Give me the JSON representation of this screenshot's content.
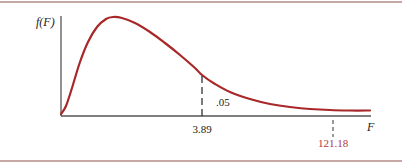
{
  "chart_data": {
    "type": "line",
    "title": "",
    "subtitle": "",
    "xlabel": "F",
    "ylabel": "f(F)",
    "grid": false,
    "legend": null,
    "x_ticks": [
      {
        "value": 3.89,
        "label": "3.89",
        "color": "#222222"
      },
      {
        "value": 121.18,
        "label": "121.18",
        "color": "#b03a3a"
      }
    ],
    "annotations": [
      {
        "text": ".05",
        "meaning": "upper-tail area to the right of 3.89"
      }
    ],
    "series": [
      {
        "name": "f(F)",
        "color": "#a8282a",
        "points_px": [
          [
            61,
            114
          ],
          [
            66,
            106
          ],
          [
            72,
            88
          ],
          [
            80,
            62
          ],
          [
            88,
            42
          ],
          [
            97,
            27
          ],
          [
            106,
            19
          ],
          [
            113,
            17
          ],
          [
            122,
            18
          ],
          [
            135,
            23
          ],
          [
            150,
            32
          ],
          [
            165,
            43
          ],
          [
            180,
            55
          ],
          [
            195,
            68
          ],
          [
            202,
            75
          ],
          [
            215,
            84
          ],
          [
            230,
            92
          ],
          [
            250,
            99
          ],
          [
            270,
            104
          ],
          [
            290,
            107
          ],
          [
            310,
            109
          ],
          [
            330,
            110
          ],
          [
            350,
            110.5
          ],
          [
            370,
            110.5
          ]
        ]
      }
    ]
  },
  "labels": {
    "y_axis": "f(F)",
    "x_axis": "F",
    "critical_value": "3.89",
    "tail_area": ".05",
    "observed_value": "121.18"
  },
  "colors": {
    "curve": "#a8282a",
    "axis": "#555555",
    "frame": "#c8a8a5",
    "observed_label": "#b03a3a",
    "text": "#222222"
  }
}
